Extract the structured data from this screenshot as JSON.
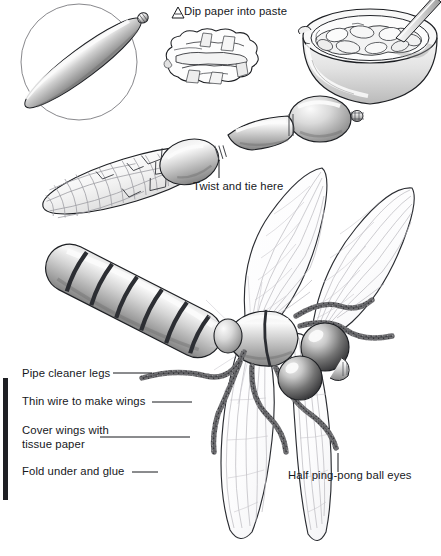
{
  "illustration": {
    "title": "Papier-mache dragonfly craft instructions",
    "subject": "dragonfly",
    "style": "grayscale pen-and-ink with airbrush shading",
    "background_color": "#ffffff",
    "ink_color": "#16181c",
    "palette": {
      "highlight": "#f4f4f4",
      "light_gray": "#dcdcdc",
      "mid_gray": "#b4b4b4",
      "shade_gray": "#8e8e8e",
      "dark_gray": "#5a5a5a",
      "band_dark": "#2f3136",
      "outline": "#1a1c20",
      "wing_vein": "#b8b6bc",
      "wing_fill": "#fdfdfd"
    }
  },
  "labels": [
    {
      "id": "dip-paper-into-paste",
      "text": "Dip paper into paste",
      "x": 184,
      "y": 6,
      "leader": "arrow-marker-left"
    },
    {
      "id": "twist-and-tie-here",
      "text": "Twist and tie here",
      "x": 193,
      "y": 181,
      "leader": "vertical-tick-up"
    },
    {
      "id": "pipe-cleaner-legs",
      "text": "Pipe cleaner legs",
      "x": 22,
      "y": 368,
      "leader": "horizontal-line-right"
    },
    {
      "id": "thin-wire-to-make-wings",
      "text": "Thin wire to make wings",
      "x": 22,
      "y": 396,
      "leader": "horizontal-line-right"
    },
    {
      "id": "cover-wings-with-tissue-paper",
      "text": "Cover wings with tissue paper",
      "line1": "Cover wings with",
      "line2": "tissue paper",
      "x": 22,
      "y": 424,
      "leader": "horizontal-line-right"
    },
    {
      "id": "fold-under-and-glue",
      "text": "Fold under and glue",
      "x": 22,
      "y": 466,
      "leader": "horizontal-line-right"
    },
    {
      "id": "half-ping-pong-ball-eyes",
      "text": "Half ping-pong ball eyes",
      "x": 288,
      "y": 470,
      "leader": "vertical-tick-up"
    }
  ],
  "scene_objects": [
    {
      "name": "guide-circle",
      "desc": "thin outline circle behind the plain balloon",
      "cx": 79,
      "cy": 62,
      "r": 58
    },
    {
      "name": "plain-balloon",
      "desc": "long uninflated-style balloon lying diagonally, with tied nozzle at upper right"
    },
    {
      "name": "torn-paper-pile",
      "desc": "heap of torn paper strips"
    },
    {
      "name": "paste-bowl",
      "desc": "round bowl filled with paste and torn paper, with a mixing stick"
    },
    {
      "name": "pasted-balloon-body",
      "desc": "long balloon covered with overlapping paper strips"
    },
    {
      "name": "head-balloon",
      "desc": "round balloon forming the head, joined by a twist"
    },
    {
      "name": "striped-abdomen",
      "desc": "finished abdomen painted with six dark bands"
    },
    {
      "name": "dragonfly-wings",
      "desc": "four translucent veined wings made of wire and tissue paper"
    },
    {
      "name": "dragonfly-thorax",
      "desc": "banded thorax segment"
    },
    {
      "name": "pipe-cleaner-legs",
      "desc": "six fuzzy pipe-cleaner legs"
    },
    {
      "name": "ping-pong-eyes",
      "desc": "two half ping-pong ball eyes"
    },
    {
      "name": "left-margin-bar",
      "desc": "solid dark vertical rule at page left edge",
      "x": 3,
      "y": 378,
      "w": 5,
      "h": 122
    }
  ]
}
